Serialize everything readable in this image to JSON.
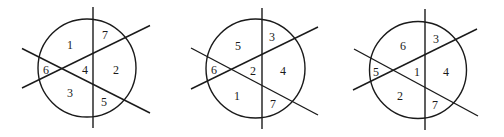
{
  "diagrams": [
    {
      "circle": {
        "cx": 87,
        "cy": 68,
        "r": 49
      },
      "lines": {
        "vertical": {
          "x1": 93,
          "y1": 7,
          "x2": 93,
          "y2": 128
        },
        "rising": {
          "x1": 22,
          "y1": 88,
          "x2": 150,
          "y2": 25.5
        },
        "falling": {
          "x1": 22,
          "y1": 48.5,
          "x2": 150,
          "y2": 113
        }
      },
      "regions": [
        {
          "label": "1",
          "x": 70,
          "y": 45
        },
        {
          "label": "7",
          "x": 105,
          "y": 35
        },
        {
          "label": "6",
          "x": 46,
          "y": 70
        },
        {
          "label": "4",
          "x": 85,
          "y": 70
        },
        {
          "label": "2",
          "x": 116,
          "y": 70
        },
        {
          "label": "3",
          "x": 70,
          "y": 93
        },
        {
          "label": "5",
          "x": 104,
          "y": 102
        }
      ]
    },
    {
      "circle": {
        "cx": 255.5,
        "cy": 68.5,
        "r": 49.5
      },
      "lines": {
        "vertical": {
          "x1": 262,
          "y1": 8,
          "x2": 262,
          "y2": 129
        },
        "rising": {
          "x1": 191,
          "y1": 89,
          "x2": 318,
          "y2": 27
        },
        "falling": {
          "x1": 191,
          "y1": 48,
          "x2": 318,
          "y2": 115
        }
      },
      "regions": [
        {
          "label": "5",
          "x": 238,
          "y": 46
        },
        {
          "label": "3",
          "x": 272,
          "y": 37
        },
        {
          "label": "6",
          "x": 214,
          "y": 70
        },
        {
          "label": "2",
          "x": 253,
          "y": 71
        },
        {
          "label": "4",
          "x": 283,
          "y": 71
        },
        {
          "label": "1",
          "x": 237,
          "y": 96
        },
        {
          "label": "7",
          "x": 273,
          "y": 104
        }
      ]
    },
    {
      "circle": {
        "cx": 418,
        "cy": 70,
        "r": 48.5
      },
      "lines": {
        "vertical": {
          "x1": 425,
          "y1": 9,
          "x2": 425,
          "y2": 130
        },
        "rising": {
          "x1": 353,
          "y1": 90,
          "x2": 477,
          "y2": 29
        },
        "falling": {
          "x1": 354,
          "y1": 49,
          "x2": 478,
          "y2": 116
        }
      },
      "regions": [
        {
          "label": "6",
          "x": 403,
          "y": 46
        },
        {
          "label": "3",
          "x": 436,
          "y": 39
        },
        {
          "label": "5",
          "x": 376,
          "y": 72
        },
        {
          "label": "1",
          "x": 417,
          "y": 72
        },
        {
          "label": "4",
          "x": 446,
          "y": 72
        },
        {
          "label": "2",
          "x": 400,
          "y": 96
        },
        {
          "label": "7",
          "x": 435,
          "y": 105
        }
      ]
    }
  ],
  "colors": {
    "stroke": "#1a1a1a",
    "background": "#ffffff"
  }
}
